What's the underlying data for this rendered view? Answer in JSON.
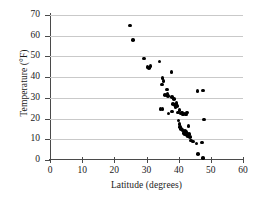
{
  "chart_data": {
    "type": "scatter",
    "title": "",
    "xlabel": "Latitude (degrees)",
    "ylabel": "Temperature (°F)",
    "xlim": [
      0,
      60
    ],
    "ylim": [
      0,
      70
    ],
    "xticks": [
      0,
      10,
      20,
      30,
      40,
      50,
      60
    ],
    "yticks": [
      0,
      10,
      20,
      30,
      40,
      50,
      60,
      70
    ],
    "grid": "horizontal",
    "legend": "none",
    "marker": "filled-circle-black",
    "points": [
      {
        "x": 24.8,
        "y": 65.0
      },
      {
        "x": 25.8,
        "y": 58.0
      },
      {
        "x": 29.2,
        "y": 49.0
      },
      {
        "x": 30.3,
        "y": 44.8
      },
      {
        "x": 30.8,
        "y": 44.5
      },
      {
        "x": 31.2,
        "y": 45.5
      },
      {
        "x": 34.0,
        "y": 47.5
      },
      {
        "x": 37.8,
        "y": 42.5
      },
      {
        "x": 35.0,
        "y": 39.5
      },
      {
        "x": 35.3,
        "y": 38.0
      },
      {
        "x": 34.8,
        "y": 36.5
      },
      {
        "x": 36.4,
        "y": 34.0
      },
      {
        "x": 35.7,
        "y": 31.5
      },
      {
        "x": 36.5,
        "y": 32.0
      },
      {
        "x": 36.6,
        "y": 31.0
      },
      {
        "x": 34.3,
        "y": 24.5
      },
      {
        "x": 35.0,
        "y": 24.5
      },
      {
        "x": 36.9,
        "y": 22.5
      },
      {
        "x": 38.0,
        "y": 30.5
      },
      {
        "x": 38.6,
        "y": 29.5
      },
      {
        "x": 38.3,
        "y": 27.0
      },
      {
        "x": 38.8,
        "y": 26.5
      },
      {
        "x": 39.2,
        "y": 26.8
      },
      {
        "x": 39.5,
        "y": 26.0
      },
      {
        "x": 39.3,
        "y": 27.5
      },
      {
        "x": 39.0,
        "y": 25.5
      },
      {
        "x": 38.0,
        "y": 23.5
      },
      {
        "x": 39.8,
        "y": 23.0
      },
      {
        "x": 40.2,
        "y": 24.0
      },
      {
        "x": 40.6,
        "y": 22.5
      },
      {
        "x": 41.0,
        "y": 23.0
      },
      {
        "x": 41.4,
        "y": 22.0
      },
      {
        "x": 41.8,
        "y": 22.5
      },
      {
        "x": 42.2,
        "y": 22.0
      },
      {
        "x": 42.6,
        "y": 23.0
      },
      {
        "x": 40.0,
        "y": 19.0
      },
      {
        "x": 40.2,
        "y": 17.5
      },
      {
        "x": 40.5,
        "y": 16.0
      },
      {
        "x": 40.8,
        "y": 15.0
      },
      {
        "x": 41.2,
        "y": 14.5
      },
      {
        "x": 41.5,
        "y": 13.0
      },
      {
        "x": 41.8,
        "y": 12.5
      },
      {
        "x": 42.0,
        "y": 14.0
      },
      {
        "x": 42.3,
        "y": 13.5
      },
      {
        "x": 42.5,
        "y": 12.0
      },
      {
        "x": 42.8,
        "y": 11.5
      },
      {
        "x": 43.2,
        "y": 12.5
      },
      {
        "x": 43.6,
        "y": 11.0
      },
      {
        "x": 43.0,
        "y": 16.5
      },
      {
        "x": 43.8,
        "y": 9.5
      },
      {
        "x": 44.5,
        "y": 9.0
      },
      {
        "x": 45.5,
        "y": 8.0
      },
      {
        "x": 47.3,
        "y": 8.5
      },
      {
        "x": 46.0,
        "y": 3.0
      },
      {
        "x": 47.5,
        "y": 1.0
      },
      {
        "x": 45.8,
        "y": 33.3
      },
      {
        "x": 47.5,
        "y": 33.5
      },
      {
        "x": 47.8,
        "y": 19.5
      }
    ]
  },
  "axes": {
    "y_tick_labels": [
      "0",
      "10",
      "20",
      "30",
      "40",
      "50",
      "60",
      "70"
    ],
    "x_tick_labels": [
      "0",
      "10",
      "20",
      "30",
      "40",
      "50",
      "60"
    ]
  }
}
